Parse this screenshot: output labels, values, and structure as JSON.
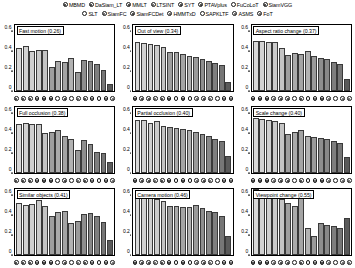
{
  "figure": {
    "kind": "vot-attribute-bar-grid",
    "background": "#ffffff",
    "axis_color": "#000000"
  },
  "legend": {
    "rows": [
      [
        {
          "label": "MBMD",
          "marker": "dot"
        },
        {
          "label": "DaSiam_LT",
          "marker": "dot"
        },
        {
          "label": "MMLT",
          "marker": "dot"
        },
        {
          "label": "LTSINT",
          "marker": "ring"
        },
        {
          "label": "SYT",
          "marker": "dot"
        },
        {
          "label": "PTAVplus",
          "marker": "dot"
        },
        {
          "label": "FuCoLoT",
          "marker": "open"
        },
        {
          "label": "SiamVGG",
          "marker": "dot"
        }
      ],
      [
        {
          "label": "SLT",
          "marker": "open"
        },
        {
          "label": "SiamFC",
          "marker": "ring"
        },
        {
          "label": "SiamFCDet",
          "marker": "dot"
        },
        {
          "label": "HMMTxD",
          "marker": "ring"
        },
        {
          "label": "SAPKLTF",
          "marker": "open"
        },
        {
          "label": "ASMS",
          "marker": "ring"
        },
        {
          "label": "FoT",
          "marker": "ring"
        }
      ]
    ]
  },
  "axes": {
    "y_ticks": [
      "0",
      "0.2",
      "0.4",
      "0.6"
    ],
    "y_min": 0,
    "y_max": 0.68,
    "x_markers": [
      "dot",
      "dot",
      "dot",
      "ring",
      "dot",
      "dot",
      "open",
      "dot",
      "open",
      "ring",
      "dot",
      "ring",
      "open",
      "ring",
      "ring"
    ]
  },
  "chart_data": [
    {
      "type": "bar",
      "title": "Fast motion (0.26)",
      "attribute": "Fast motion",
      "overall": 0.26,
      "xlabel": "",
      "ylabel": "",
      "ylim": [
        0,
        0.68
      ],
      "yticks": [
        0,
        0.2,
        0.4,
        0.6
      ],
      "grid": false,
      "categories": [
        "MBMD",
        "DaSiam_LT",
        "MMLT",
        "LTSINT",
        "SYT",
        "PTAVplus",
        "FuCoLoT",
        "SiamVGG",
        "SLT",
        "SiamFC",
        "SiamFCDet",
        "HMMTxD",
        "SAPKLTF",
        "ASMS",
        "FoT"
      ],
      "values": [
        0.44,
        0.46,
        0.41,
        0.42,
        0.42,
        0.25,
        0.31,
        0.3,
        0.34,
        0.2,
        0.32,
        0.31,
        0.28,
        0.22,
        0.07
      ]
    },
    {
      "type": "bar",
      "title": "Out of view (0.34)",
      "attribute": "Out of view",
      "overall": 0.34,
      "xlabel": "",
      "ylabel": "",
      "ylim": [
        0,
        0.68
      ],
      "yticks": [
        0,
        0.2,
        0.4,
        0.6
      ],
      "grid": false,
      "categories": [
        "MBMD",
        "DaSiam_LT",
        "MMLT",
        "LTSINT",
        "SYT",
        "PTAVplus",
        "FuCoLoT",
        "SiamVGG",
        "SLT",
        "SiamFC",
        "SiamFCDet",
        "HMMTxD",
        "SAPKLTF",
        "ASMS",
        "FoT"
      ],
      "values": [
        0.5,
        0.49,
        0.48,
        0.47,
        0.45,
        0.4,
        0.4,
        0.38,
        0.36,
        0.35,
        0.33,
        0.31,
        0.29,
        0.27,
        0.09
      ]
    },
    {
      "type": "bar",
      "title": "Aspect ratio change (0.37)",
      "attribute": "Aspect ratio change",
      "overall": 0.37,
      "xlabel": "",
      "ylabel": "",
      "ylim": [
        0,
        0.68
      ],
      "yticks": [
        0,
        0.2,
        0.4,
        0.6
      ],
      "grid": false,
      "categories": [
        "MBMD",
        "DaSiam_LT",
        "MMLT",
        "LTSINT",
        "SYT",
        "PTAVplus",
        "FuCoLoT",
        "SiamVGG",
        "SLT",
        "SiamFC",
        "SiamFCDet",
        "HMMTxD",
        "SAPKLTF",
        "ASMS",
        "FoT"
      ],
      "values": [
        0.52,
        0.52,
        0.51,
        0.5,
        0.44,
        0.37,
        0.39,
        0.38,
        0.41,
        0.36,
        0.34,
        0.33,
        0.3,
        0.28,
        0.12
      ]
    },
    {
      "type": "bar",
      "title": "Full occlusion (0.38)",
      "attribute": "Full occlusion",
      "overall": 0.38,
      "xlabel": "",
      "ylabel": "",
      "ylim": [
        0,
        0.68
      ],
      "yticks": [
        0,
        0.2,
        0.4,
        0.6
      ],
      "grid": false,
      "categories": [
        "MBMD",
        "DaSiam_LT",
        "MMLT",
        "LTSINT",
        "SYT",
        "PTAVplus",
        "FuCoLoT",
        "SiamVGG",
        "SLT",
        "SiamFC",
        "SiamFCDet",
        "HMMTxD",
        "SAPKLTF",
        "ASMS",
        "FoT"
      ],
      "values": [
        0.5,
        0.52,
        0.51,
        0.51,
        0.41,
        0.42,
        0.44,
        0.38,
        0.35,
        0.24,
        0.34,
        0.3,
        0.22,
        0.21,
        0.11
      ]
    },
    {
      "type": "bar",
      "title": "Partial occlusion (0.40)",
      "attribute": "Partial occlusion",
      "overall": 0.4,
      "xlabel": "",
      "ylabel": "",
      "ylim": [
        0,
        0.68
      ],
      "yticks": [
        0,
        0.2,
        0.4,
        0.6
      ],
      "grid": false,
      "categories": [
        "MBMD",
        "DaSiam_LT",
        "MMLT",
        "LTSINT",
        "SYT",
        "PTAVplus",
        "FuCoLoT",
        "SiamVGG",
        "SLT",
        "SiamFC",
        "SiamFCDet",
        "HMMTxD",
        "SAPKLTF",
        "ASMS",
        "FoT"
      ],
      "values": [
        0.55,
        0.55,
        0.52,
        0.54,
        0.48,
        0.47,
        0.46,
        0.45,
        0.44,
        0.42,
        0.4,
        0.38,
        0.35,
        0.33,
        0.18
      ]
    },
    {
      "type": "bar",
      "title": "Scale change (0.40)",
      "attribute": "Scale change",
      "overall": 0.4,
      "xlabel": "",
      "ylabel": "",
      "ylim": [
        0,
        0.68
      ],
      "yticks": [
        0,
        0.2,
        0.4,
        0.6
      ],
      "grid": false,
      "categories": [
        "MBMD",
        "DaSiam_LT",
        "MMLT",
        "LTSINT",
        "SYT",
        "PTAVplus",
        "FuCoLoT",
        "SiamVGG",
        "SLT",
        "SiamFC",
        "SiamFCDet",
        "HMMTxD",
        "SAPKLTF",
        "ASMS",
        "FoT"
      ],
      "values": [
        0.57,
        0.56,
        0.55,
        0.54,
        0.52,
        0.4,
        0.42,
        0.44,
        0.38,
        0.37,
        0.36,
        0.35,
        0.33,
        0.31,
        0.16
      ]
    },
    {
      "type": "bar",
      "title": "Similar objects (0.41)",
      "attribute": "Similar objects",
      "overall": 0.41,
      "xlabel": "",
      "ylabel": "",
      "ylim": [
        0,
        0.68
      ],
      "yticks": [
        0,
        0.2,
        0.4,
        0.6
      ],
      "grid": false,
      "categories": [
        "MBMD",
        "DaSiam_LT",
        "MMLT",
        "LTSINT",
        "SYT",
        "PTAVplus",
        "FuCoLoT",
        "SiamVGG",
        "SLT",
        "SiamFC",
        "SiamFCDet",
        "HMMTxD",
        "SAPKLTF",
        "ASMS",
        "FoT"
      ],
      "values": [
        0.54,
        0.52,
        0.53,
        0.57,
        0.51,
        0.4,
        0.44,
        0.45,
        0.33,
        0.35,
        0.42,
        0.43,
        0.4,
        0.34,
        0.15
      ]
    },
    {
      "type": "bar",
      "title": "Camera motion (0.46)",
      "attribute": "Camera motion",
      "overall": 0.46,
      "xlabel": "",
      "ylabel": "",
      "ylim": [
        0,
        0.68
      ],
      "yticks": [
        0,
        0.2,
        0.4,
        0.6
      ],
      "grid": false,
      "categories": [
        "MBMD",
        "DaSiam_LT",
        "MMLT",
        "LTSINT",
        "SYT",
        "PTAVplus",
        "FuCoLoT",
        "SiamVGG",
        "SLT",
        "SiamFC",
        "SiamFCDet",
        "HMMTxD",
        "SAPKLTF",
        "ASMS",
        "FoT"
      ],
      "values": [
        0.6,
        0.63,
        0.59,
        0.58,
        0.56,
        0.51,
        0.5,
        0.49,
        0.49,
        0.52,
        0.48,
        0.45,
        0.44,
        0.4,
        0.2
      ]
    },
    {
      "type": "bar",
      "title": "Viewpoint change (0.55)",
      "attribute": "Viewpoint change",
      "overall": 0.55,
      "xlabel": "",
      "ylabel": "",
      "ylim": [
        0,
        0.68
      ],
      "yticks": [
        0,
        0.2,
        0.4,
        0.6
      ],
      "grid": false,
      "categories": [
        "MBMD",
        "DaSiam_LT",
        "MMLT",
        "LTSINT",
        "SYT",
        "PTAVplus",
        "FuCoLoT",
        "SiamVGG",
        "SLT",
        "SiamFC",
        "SiamFCDet",
        "HMMTxD",
        "SAPKLTF",
        "ASMS",
        "FoT"
      ],
      "values": [
        0.68,
        0.67,
        0.67,
        0.67,
        0.58,
        0.54,
        0.5,
        0.65,
        0.28,
        0.2,
        0.33,
        0.31,
        0.3,
        0.28,
        0.38
      ]
    }
  ]
}
